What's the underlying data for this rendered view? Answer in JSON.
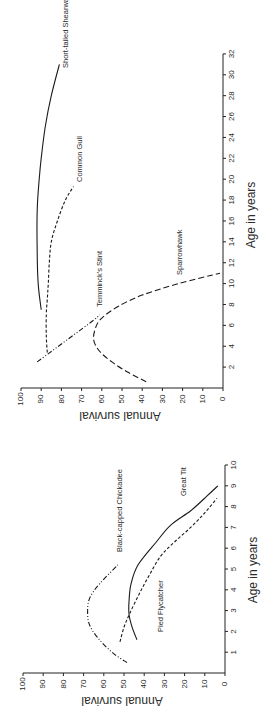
{
  "chart_data": [
    {
      "type": "line",
      "panel": "upper",
      "orientation": "rotated 90 degrees counter-clockwise",
      "title": "",
      "xlabel": "Age in years",
      "ylabel": "Annual survival",
      "xlim": [
        0,
        32
      ],
      "ylim": [
        0,
        100
      ],
      "x_ticks": [
        "2",
        "4",
        "6",
        "8",
        "10",
        "12",
        "14",
        "16",
        "18",
        "20",
        "22",
        "24",
        "26",
        "28",
        "30",
        "32"
      ],
      "y_ticks": [
        "0",
        "10",
        "20",
        "30",
        "40",
        "50",
        "60",
        "70",
        "80",
        "90",
        "100"
      ],
      "grid": false,
      "legend": "inline labels",
      "series": [
        {
          "name": "Short-tailed Shearwater",
          "style": "solid",
          "x": [
            7.5,
            10,
            13,
            17,
            20,
            22,
            25,
            28,
            31
          ],
          "y": [
            90,
            91.5,
            92,
            92,
            91,
            90,
            88,
            85,
            81
          ]
        },
        {
          "name": "Common Gull",
          "style": "dashed",
          "x": [
            3.4,
            5,
            7,
            8.5,
            10,
            12,
            14,
            16,
            18,
            19.3
          ],
          "y": [
            87,
            87.5,
            87.5,
            87,
            86.5,
            86,
            85,
            82,
            78,
            74
          ]
        },
        {
          "name": "Temminck's Stint",
          "style": "dash-dot-dot",
          "x": [
            2.5,
            3.5,
            4.5,
            5.5,
            6.5,
            7
          ],
          "y": [
            92,
            85,
            78,
            71,
            64,
            61
          ]
        },
        {
          "name": "Sparrowhawk",
          "style": "long-dash",
          "x": [
            0.6,
            1.5,
            2.5,
            3.5,
            4.6,
            5.8,
            6.7,
            7.8,
            8.9,
            10,
            11
          ],
          "y": [
            38,
            47,
            55,
            61,
            64,
            63,
            60,
            52,
            40,
            22,
            1.5
          ]
        }
      ]
    },
    {
      "type": "line",
      "panel": "lower",
      "orientation": "rotated 90 degrees counter-clockwise",
      "title": "",
      "xlabel": "Age in years",
      "ylabel": "Annual survival",
      "xlim": [
        0,
        10
      ],
      "ylim": [
        0,
        100
      ],
      "x_ticks": [
        "1",
        "2",
        "3",
        "4",
        "5",
        "6",
        "7",
        "8",
        "9",
        "10"
      ],
      "y_ticks": [
        "0",
        "10",
        "20",
        "30",
        "40",
        "50",
        "60",
        "70",
        "80",
        "90",
        "100"
      ],
      "grid": false,
      "legend": "inline labels",
      "series": [
        {
          "name": "Black-capped Chickadee",
          "style": "dash-dot-dot",
          "x": [
            0.5,
            1,
            1.7,
            2.3,
            2.9,
            3.6,
            4.3,
            5.2
          ],
          "y": [
            48.5,
            56,
            63,
            67,
            68,
            67,
            62,
            53
          ]
        },
        {
          "name": "Great Tit",
          "style": "solid",
          "x": [
            1.6,
            2.2,
            2.8,
            3.5,
            4.3,
            5.2,
            6.3,
            7.1,
            7.8,
            8.5,
            9
          ],
          "y": [
            43.6,
            46,
            47.5,
            47.5,
            46.5,
            43,
            34,
            27,
            17,
            9,
            3.5
          ]
        },
        {
          "name": "Pied Flycatcher",
          "style": "dashed",
          "x": [
            1.5,
            2.2,
            2.9,
            3.8,
            4.7,
            5.6,
            6.3,
            7,
            7.7,
            8.4
          ],
          "y": [
            52,
            50,
            47,
            42.5,
            37.5,
            32,
            25,
            17,
            10,
            4
          ]
        }
      ]
    }
  ]
}
